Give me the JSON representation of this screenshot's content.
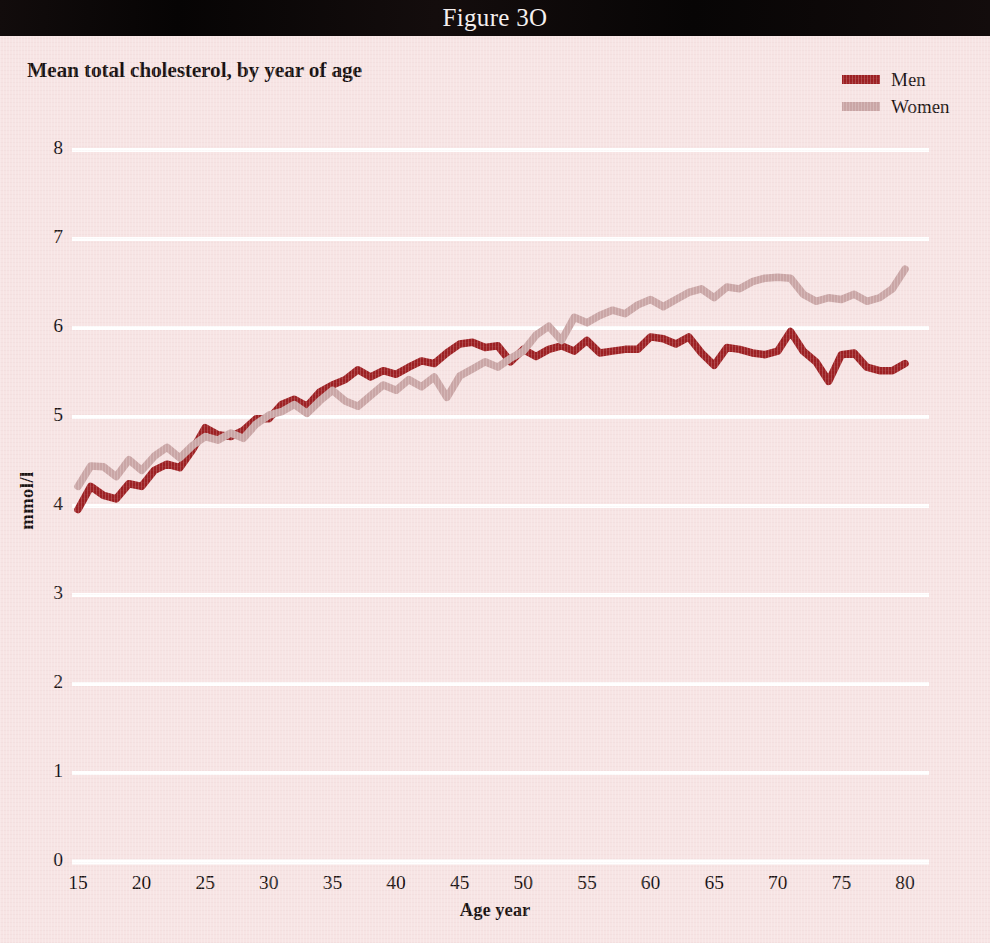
{
  "figure": {
    "number_label": "Figure 3O",
    "title": "Mean total cholesterol, by year of age"
  },
  "legend": {
    "position": "top-right",
    "entries": [
      {
        "label": "Men",
        "color": "#9d2023",
        "swatch_name": "legend-swatch-men"
      },
      {
        "label": "Women",
        "color": "#caa6a6",
        "swatch_name": "legend-swatch-women"
      }
    ]
  },
  "axes": {
    "x": {
      "title": "Age year",
      "ticks": [
        "15",
        "20",
        "25",
        "30",
        "35",
        "40",
        "45",
        "50",
        "55",
        "60",
        "65",
        "70",
        "75",
        "80"
      ],
      "min": 15,
      "max": 80
    },
    "y": {
      "title": "mmol/l",
      "ticks": [
        "8",
        "7",
        "6",
        "5",
        "4",
        "3",
        "2",
        "1",
        "0"
      ],
      "min": 0,
      "max": 8
    }
  },
  "colors": {
    "background": "#f7e4e4",
    "header_bar": "#0b0707",
    "header_text": "#f4efef",
    "gridline": "#ffffff",
    "men": "#9d2023",
    "women": "#caa6a6",
    "text": "#17100f"
  },
  "chart_data": {
    "type": "line",
    "title": "Mean total cholesterol, by year of age",
    "xlabel": "Age year",
    "ylabel": "mmol/l",
    "xlim": [
      15,
      80
    ],
    "ylim": [
      0,
      8
    ],
    "yticks": [
      0,
      1,
      2,
      3,
      4,
      5,
      6,
      7,
      8
    ],
    "xticks": [
      15,
      20,
      25,
      30,
      35,
      40,
      45,
      50,
      55,
      60,
      65,
      70,
      75,
      80
    ],
    "grid": "horizontal",
    "legend_position": "top-right",
    "x": [
      15,
      16,
      17,
      18,
      19,
      20,
      21,
      22,
      23,
      24,
      25,
      26,
      27,
      28,
      29,
      30,
      31,
      32,
      33,
      34,
      35,
      36,
      37,
      38,
      39,
      40,
      41,
      42,
      43,
      44,
      45,
      46,
      47,
      48,
      49,
      50,
      51,
      52,
      53,
      54,
      55,
      56,
      57,
      58,
      59,
      60,
      61,
      62,
      63,
      64,
      65,
      66,
      67,
      68,
      69,
      70,
      71,
      72,
      73,
      74,
      75,
      76,
      77,
      78,
      79,
      80
    ],
    "series": [
      {
        "name": "Men",
        "color": "#9d2023",
        "values": [
          3.96,
          4.22,
          4.12,
          4.08,
          4.25,
          4.22,
          4.4,
          4.47,
          4.43,
          4.63,
          4.88,
          4.8,
          4.78,
          4.85,
          4.98,
          4.98,
          5.14,
          5.2,
          5.12,
          5.28,
          5.36,
          5.42,
          5.53,
          5.45,
          5.52,
          5.48,
          5.56,
          5.63,
          5.6,
          5.72,
          5.82,
          5.84,
          5.78,
          5.8,
          5.62,
          5.76,
          5.68,
          5.76,
          5.8,
          5.74,
          5.86,
          5.72,
          5.74,
          5.76,
          5.76,
          5.9,
          5.88,
          5.82,
          5.9,
          5.72,
          5.58,
          5.78,
          5.76,
          5.72,
          5.7,
          5.74,
          5.96,
          5.74,
          5.62,
          5.4,
          5.7,
          5.72,
          5.56,
          5.52,
          5.52,
          5.6
        ]
      },
      {
        "name": "Women",
        "color": "#caa6a6",
        "values": [
          4.22,
          4.45,
          4.44,
          4.33,
          4.52,
          4.4,
          4.56,
          4.66,
          4.54,
          4.68,
          4.78,
          4.74,
          4.82,
          4.76,
          4.92,
          5.02,
          5.06,
          5.14,
          5.04,
          5.18,
          5.3,
          5.18,
          5.12,
          5.24,
          5.36,
          5.3,
          5.42,
          5.34,
          5.45,
          5.22,
          5.46,
          5.54,
          5.62,
          5.56,
          5.66,
          5.74,
          5.92,
          6.02,
          5.86,
          6.12,
          6.06,
          6.14,
          6.2,
          6.16,
          6.26,
          6.32,
          6.24,
          6.32,
          6.4,
          6.44,
          6.34,
          6.46,
          6.44,
          6.52,
          6.56,
          6.57,
          6.56,
          6.38,
          6.3,
          6.34,
          6.32,
          6.38,
          6.3,
          6.34,
          6.44,
          6.66
        ]
      }
    ]
  },
  "plot_geometry": {
    "left": 78,
    "right": 905,
    "top_value_y": 150,
    "bottom_value_y": 862
  }
}
